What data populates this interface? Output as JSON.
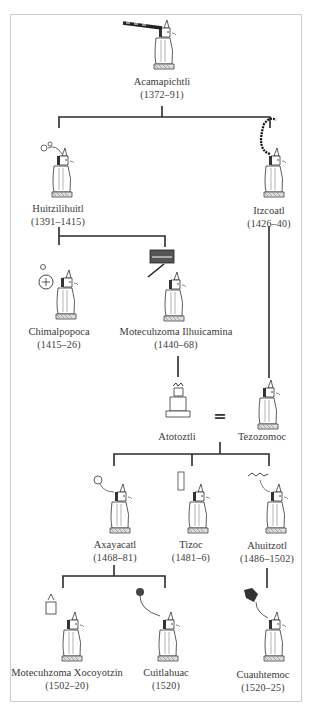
{
  "diagram": {
    "type": "genealogy-tree",
    "people": [
      {
        "id": "acamapichtli",
        "name": "Acamapichtli",
        "dates": "(1372–91)",
        "glyph": "reed-bundle-glyph"
      },
      {
        "id": "huitzilihuitl",
        "name": "Huitzilihuitl",
        "dates": "(1391–1415)",
        "glyph": "hummingbird-feather-glyph"
      },
      {
        "id": "itzcoatl",
        "name": "Itzcoatl",
        "dates": "(1426–40)",
        "glyph": "obsidian-serpent-glyph"
      },
      {
        "id": "chimalpopoca",
        "name": "Chimalpopoca",
        "dates": "(1415–26)",
        "glyph": "smoking-shield-glyph"
      },
      {
        "id": "motecuhzoma1",
        "name": "Motecuhzoma Ilhuicamina",
        "dates": "(1440–68)",
        "glyph": "sky-arrow-glyph"
      },
      {
        "id": "atotoztli",
        "name": "Atotoztli",
        "dates": "",
        "glyph": "seated-woman-figure"
      },
      {
        "id": "tezozomoc",
        "name": "Tezozomoc",
        "dates": "",
        "glyph": "seated-man-figure"
      },
      {
        "id": "axayacatl",
        "name": "Axayacatl",
        "dates": "(1468–81)",
        "glyph": "water-face-glyph"
      },
      {
        "id": "tizoc",
        "name": "Tizoc",
        "dates": "(1481–6)",
        "glyph": "leg-stone-glyph"
      },
      {
        "id": "ahuitzotl",
        "name": "Ahuitzotl",
        "dates": "(1486–1502)",
        "glyph": "water-creature-glyph"
      },
      {
        "id": "motecuhzoma2",
        "name": "Motecuhzoma Xocoyotzin",
        "dates": "(1502–20)",
        "glyph": "diadem-glyph"
      },
      {
        "id": "cuitlahuac",
        "name": "Cuitlahuac",
        "dates": "(1520)",
        "glyph": "excrement-plant-glyph"
      },
      {
        "id": "cuauhtemoc",
        "name": "Cuauhtemoc",
        "dates": "(1520–25)",
        "glyph": "descending-eagle-glyph"
      }
    ],
    "marriage_symbol": "=",
    "relations": [
      {
        "parent": "acamapichtli",
        "children": [
          "huitzilihuitl",
          "itzcoatl"
        ]
      },
      {
        "parent": "huitzilihuitl",
        "children": [
          "chimalpopoca",
          "motecuhzoma1"
        ]
      },
      {
        "parent": "motecuhzoma1",
        "children": [
          "atotoztli"
        ]
      },
      {
        "parent": "itzcoatl",
        "children": [
          "tezozomoc"
        ]
      },
      {
        "couple": [
          "atotoztli",
          "tezozomoc"
        ],
        "children": [
          "axayacatl",
          "tizoc",
          "ahuitzotl"
        ]
      },
      {
        "parent": "axayacatl",
        "children": [
          "motecuhzoma2",
          "cuitlahuac"
        ]
      },
      {
        "parent": "ahuitzotl",
        "children": [
          "cuauhtemoc"
        ]
      }
    ],
    "colors": {
      "line": "#2b2b2b",
      "frame": "#cfcfcf",
      "text": "#3a3a3a"
    }
  }
}
